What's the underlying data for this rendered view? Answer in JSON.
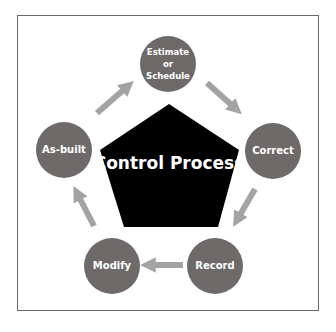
{
  "diagram": {
    "center": {
      "label": "Control Process"
    },
    "nodes": [
      {
        "id": "estimate",
        "lines": [
          "Estimate",
          "or",
          "Schedule"
        ]
      },
      {
        "id": "correct",
        "lines": [
          "Correct"
        ]
      },
      {
        "id": "record",
        "lines": [
          "Record"
        ]
      },
      {
        "id": "modify",
        "lines": [
          "Modify"
        ]
      },
      {
        "id": "as-built",
        "lines": [
          "As-built"
        ]
      }
    ],
    "flow": [
      "Estimate or Schedule",
      "Correct",
      "Record",
      "Modify",
      "As-built",
      "Estimate or Schedule"
    ],
    "colors": {
      "node_fill": "#6e6a69",
      "arrow": "#a3a3a3",
      "center_fill": "#000000",
      "frame_border": "#6a6a6a"
    }
  }
}
